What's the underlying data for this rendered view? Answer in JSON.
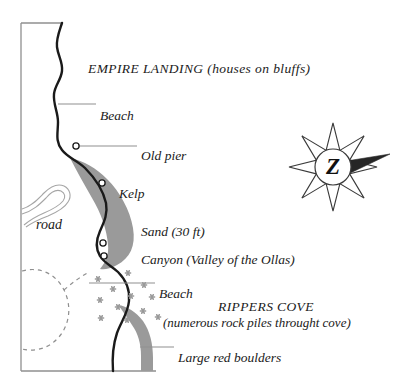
{
  "map": {
    "title_label": "EMPIRE LANDING (houses on bluffs)",
    "labels": [
      {
        "id": "empire-landing",
        "text": "EMPIRE LANDING (houses on bluffs)",
        "x": 88,
        "y": 61,
        "kind": "place"
      },
      {
        "id": "beach-north",
        "text": "Beach",
        "x": 100,
        "y": 108,
        "kind": "feature"
      },
      {
        "id": "old-pier",
        "text": "Old pier",
        "x": 141,
        "y": 148,
        "kind": "feature"
      },
      {
        "id": "kelp",
        "text": "Kelp",
        "x": 119,
        "y": 186,
        "kind": "feature"
      },
      {
        "id": "road",
        "text": "road",
        "x": 36,
        "y": 217,
        "kind": "road"
      },
      {
        "id": "sand",
        "text": "Sand (30 ft)",
        "x": 141,
        "y": 224,
        "kind": "feature"
      },
      {
        "id": "canyon",
        "text": "Canyon (Valley of the Ollas)",
        "x": 141,
        "y": 252,
        "kind": "feature"
      },
      {
        "id": "beach-south",
        "text": "Beach",
        "x": 159,
        "y": 286,
        "kind": "feature"
      },
      {
        "id": "rippers-cove",
        "text": "RIPPERS COVE",
        "x": 218,
        "y": 299,
        "kind": "place"
      },
      {
        "id": "rippers-cove-note",
        "text": "(numerous rock piles throught cove)",
        "x": 163,
        "y": 315,
        "kind": "sub"
      },
      {
        "id": "large-red-boulders",
        "text": "Large red boulders",
        "x": 178,
        "y": 350,
        "kind": "feature"
      }
    ],
    "compass": {
      "center_letter": "Z",
      "cx": 333,
      "cy": 167,
      "outer_radius": 44,
      "inner_radius": 18,
      "points": 8,
      "needle_direction_deg": 10
    },
    "markers": {
      "point_markers": [
        {
          "id": "old-pier-marker",
          "x": 76,
          "y": 146,
          "r": 3.1
        },
        {
          "id": "kelp-marker",
          "x": 102,
          "y": 183,
          "r": 3.1
        },
        {
          "id": "canyon-marker-upper",
          "x": 103,
          "y": 243,
          "r": 3.1
        },
        {
          "id": "canyon-marker-lower",
          "x": 104,
          "y": 256,
          "r": 3.1
        }
      ],
      "rock_piles": [
        {
          "x": 98,
          "y": 279
        },
        {
          "x": 128,
          "y": 273
        },
        {
          "x": 113,
          "y": 289
        },
        {
          "x": 144,
          "y": 285
        },
        {
          "x": 100,
          "y": 300
        },
        {
          "x": 131,
          "y": 296
        },
        {
          "x": 152,
          "y": 297
        },
        {
          "x": 118,
          "y": 307
        },
        {
          "x": 143,
          "y": 311
        },
        {
          "x": 101,
          "y": 318
        },
        {
          "x": 127,
          "y": 320
        },
        {
          "x": 158,
          "y": 317
        }
      ]
    },
    "leader_lines": [
      {
        "id": "beach-north-leader",
        "x1": 58,
        "y1": 104,
        "x2": 96,
        "y2": 104
      },
      {
        "id": "old-pier-leader",
        "x1": 76,
        "y1": 146,
        "x2": 137,
        "y2": 146
      },
      {
        "id": "beach-south-leader",
        "x1": 89,
        "y1": 283,
        "x2": 155,
        "y2": 283
      },
      {
        "id": "boulders-leader",
        "x1": 140,
        "y1": 347,
        "x2": 174,
        "y2": 347
      }
    ],
    "colors": {
      "coastline": "#1a1a1a",
      "shading": "#9a9a9a",
      "frame": "#8f8f8f",
      "road": "#a6a6a6",
      "text": "#1a1a1a",
      "rock_pile": "#9a9a9a",
      "background": "#ffffff"
    },
    "frame": {
      "left_x": 21,
      "top_y": 23,
      "bottom_y": 371,
      "top_right_x": 62,
      "bottom_right_x": 156
    }
  }
}
